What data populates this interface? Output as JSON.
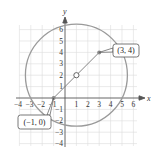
{
  "figure": {
    "type": "coordinate-plane-circle",
    "x_axis_label": "x",
    "y_axis_label": "y",
    "x_ticks": [
      "−4",
      "−3",
      "−2",
      "−1",
      "1",
      "2",
      "3",
      "4",
      "5",
      "6"
    ],
    "y_ticks": [
      "6",
      "5",
      "4",
      "3",
      "2",
      "1",
      "−1",
      "−2",
      "−3",
      "−4"
    ],
    "x_range": [
      -4,
      6
    ],
    "y_range": [
      -4,
      6
    ],
    "circle": {
      "center": [
        1,
        2
      ],
      "radius_squared": 20
    },
    "points": [
      {
        "coords": [
          3,
          4
        ],
        "label": "(3, 4)"
      },
      {
        "coords": [
          -1,
          0
        ],
        "label": "(−1, 0)"
      }
    ],
    "center_marker": "open-circle",
    "colors": {
      "grid": "#d9d9d9",
      "axis": "#555555",
      "circle": "#999999",
      "diameter": "#777777",
      "text": "#333333"
    }
  }
}
